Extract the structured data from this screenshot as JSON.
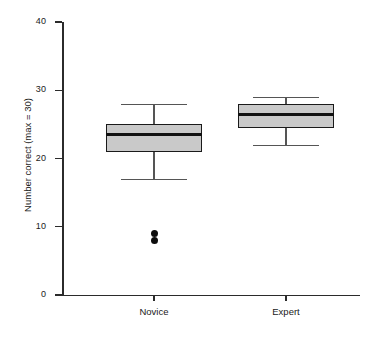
{
  "chart_data": {
    "type": "box",
    "title": "",
    "xlabel": "",
    "ylabel": "Number correct (max = 30)",
    "ylim": [
      0,
      40
    ],
    "yticks": [
      0,
      10,
      20,
      30,
      40
    ],
    "ytick_labels": [
      "0",
      "10",
      "20",
      "30",
      "40"
    ],
    "grid": false,
    "legend": "none",
    "categories": [
      "Novice",
      "Expert"
    ],
    "boxes": [
      {
        "category": "Novice",
        "whisker_low": 17,
        "q1": 21,
        "median": 23.5,
        "q3": 25,
        "whisker_high": 28,
        "outliers": [
          9,
          8
        ]
      },
      {
        "category": "Expert",
        "whisker_low": 22,
        "q1": 24.5,
        "median": 26.5,
        "q3": 28,
        "whisker_high": 29,
        "outliers": []
      }
    ],
    "colors": {
      "box_fill": "#c9c9c9",
      "box_edge": "#1a1a1a",
      "median": "#111111",
      "whisker": "#555555",
      "outlier": "#0d0d0d",
      "axis": "#2b2b2b"
    }
  }
}
